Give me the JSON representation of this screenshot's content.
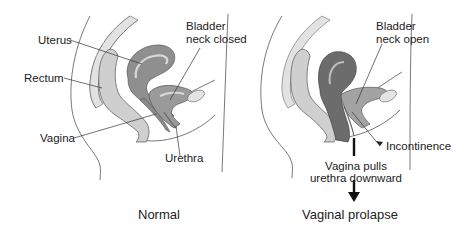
{
  "panels": [
    {
      "id": "normal",
      "caption": "Normal",
      "labels": {
        "uterus": "Uterus",
        "rectum": "Rectum",
        "vagina": "Vagina",
        "bladder_neck_line1": "Bladder",
        "bladder_neck_line2": "neck closed",
        "urethra": "Urethra"
      }
    },
    {
      "id": "prolapse",
      "caption": "Vaginal prolapse",
      "labels": {
        "bladder_neck_line1": "Bladder",
        "bladder_neck_line2": "neck open",
        "incontinence": "Incontinence",
        "pull_line1": "Vagina pulls",
        "pull_line2": "urethra downward"
      }
    }
  ],
  "colors": {
    "outline": "#555555",
    "light_gray": "#d4d4d4",
    "mid_gray": "#a8a8a8",
    "dark_gray": "#7a7a7a",
    "darkest_gray": "#5e5e5e",
    "arrow": "#111111"
  }
}
